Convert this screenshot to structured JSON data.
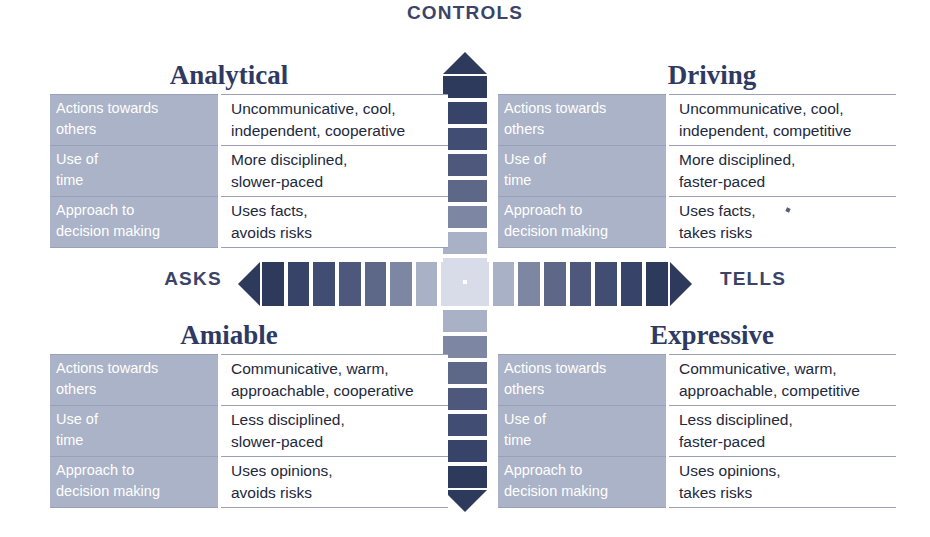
{
  "axes": {
    "top_label": "CONTROLS",
    "left_label": "ASKS",
    "right_label": "TELLS"
  },
  "colors": {
    "darkest": "#2e3a5c",
    "lightest": "#d8dce8",
    "label_bg": "#aab3c7",
    "title_text": "#2f3a63",
    "body_text": "#23283c",
    "rule": "#9aa1b4",
    "background": "#ffffff"
  },
  "row_labels": {
    "actions": [
      "Actions towards",
      "others"
    ],
    "time": [
      "Use of",
      "time"
    ],
    "decisions": [
      "Approach to",
      "decision making"
    ]
  },
  "quadrants": [
    {
      "id": "analytical",
      "title": "Analytical",
      "position": "top-left",
      "rows": [
        {
          "label": [
            "Actions towards",
            "others"
          ],
          "value": [
            "Uncommunicative, cool,",
            "independent, cooperative"
          ]
        },
        {
          "label": [
            "Use of",
            "time"
          ],
          "value": [
            "More disciplined,",
            "slower-paced"
          ]
        },
        {
          "label": [
            "Approach to",
            "decision making"
          ],
          "value": [
            "Uses facts,",
            "avoids risks"
          ]
        }
      ]
    },
    {
      "id": "driving",
      "title": "Driving",
      "position": "top-right",
      "rows": [
        {
          "label": [
            "Actions towards",
            "others"
          ],
          "value": [
            "Uncommunicative, cool,",
            "independent, competitive"
          ]
        },
        {
          "label": [
            "Use of",
            "time"
          ],
          "value": [
            "More disciplined,",
            "faster-paced"
          ]
        },
        {
          "label": [
            "Approach to",
            "decision making"
          ],
          "value": [
            "Uses facts,",
            "takes risks"
          ]
        }
      ]
    },
    {
      "id": "amiable",
      "title": "Amiable",
      "position": "bottom-left",
      "rows": [
        {
          "label": [
            "Actions towards",
            "others"
          ],
          "value": [
            "Communicative, warm,",
            "approachable, cooperative"
          ]
        },
        {
          "label": [
            "Use of",
            "time"
          ],
          "value": [
            "Less disciplined,",
            "slower-paced"
          ]
        },
        {
          "label": [
            "Approach to",
            "decision making"
          ],
          "value": [
            "Uses opinions,",
            "avoids risks"
          ]
        }
      ]
    },
    {
      "id": "expressive",
      "title": "Expressive",
      "position": "bottom-right",
      "rows": [
        {
          "label": [
            "Actions towards",
            "others"
          ],
          "value": [
            "Communicative, warm,",
            "approachable, competitive"
          ]
        },
        {
          "label": [
            "Use of",
            "time"
          ],
          "value": [
            "Less disciplined,",
            "faster-paced"
          ]
        },
        {
          "label": [
            "Approach to",
            "decision making"
          ],
          "value": [
            "Uses opinions,",
            "takes risks"
          ]
        }
      ]
    }
  ],
  "gradient_bar": {
    "segment_count": 14,
    "shades": [
      "#2e3a5c",
      "#38436a",
      "#424d74",
      "#4e587c",
      "#5d6788",
      "#7d87a4",
      "#a9b1c6",
      "#d8dce8",
      "#d8dce8",
      "#a9b1c6",
      "#7d87a4",
      "#5d6788",
      "#4e587c",
      "#424d74",
      "#38436a",
      "#2e3a5c"
    ],
    "horizontal_arrow_left": "asks-arrow-icon",
    "horizontal_arrow_right": "tells-arrow-icon",
    "vertical_arrow_top": "controls-arrow-icon",
    "vertical_arrow_bottom": "emotes-arrow-icon"
  }
}
